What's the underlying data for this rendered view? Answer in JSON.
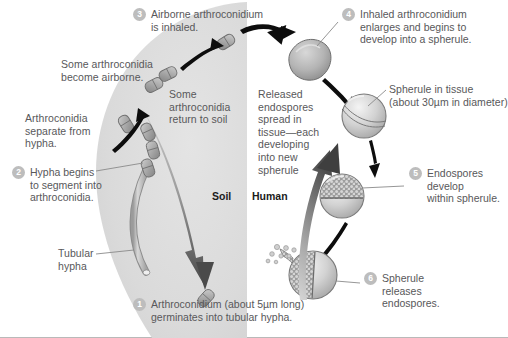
{
  "figure": {
    "title_hidden": "",
    "zones": [
      {
        "name": "soil",
        "label": "Soil"
      },
      {
        "name": "human",
        "label": "Human"
      }
    ],
    "steps": [
      {
        "num": "1",
        "text": "Arthroconidium (about 5µm long)\ngerminates into tubular hypha."
      },
      {
        "num": "2",
        "text": "Hypha begins\nto segment into\narthroconidia."
      },
      {
        "num": "3",
        "text": "Airborne arthroconidium\nis inhaled."
      },
      {
        "num": "4",
        "text": "Inhaled arthroconidium\nenlarges and begins to\ndevelop into a spherule."
      },
      {
        "num": "5",
        "text": "Endospores\ndevelop\nwithin spherule."
      },
      {
        "num": "6",
        "text": "Spherule\nreleases\nendospores."
      }
    ],
    "annotations": [
      {
        "name": "some-arthroconidia-become-airborne",
        "text": "Some arthroconidia\nbecome airborne."
      },
      {
        "name": "arthroconidia-separate-from-hypha",
        "text": "Arthroconidia\nseparate from\nhypha."
      },
      {
        "name": "some-arthroconidia-return-to-soil",
        "text": "Some\narthroconidia\nreturn to soil"
      },
      {
        "name": "tubular-hypha",
        "text": "Tubular\nhypha"
      },
      {
        "name": "spherule-in-tissue",
        "text": "Spherule in tissue\n(about 30µm in diameter)"
      },
      {
        "name": "released-endospores-spread",
        "text": "Released\nendospores\nspread in\ntissue—each\ndeveloping\ninto new\nspherule"
      }
    ],
    "colors": {
      "soil_fill": "#dcdcdc",
      "text": "#58585a",
      "zone_text": "#1b1b1b",
      "badge": "#bdbdbd",
      "arrow_black": "#0d0d0d",
      "arrow_grey": "#8d8d8d",
      "cell_fill": "#b4b4b4",
      "cell_stroke": "#6e6e6e",
      "leader": "#8a8a8a",
      "border": "#b9b9b9"
    }
  }
}
